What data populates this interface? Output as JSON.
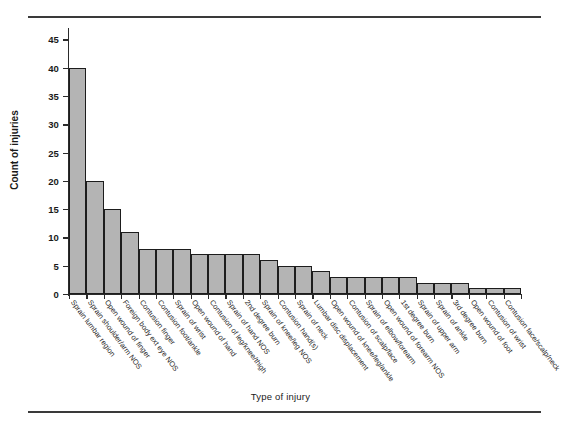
{
  "chart_data": {
    "type": "bar",
    "title": "",
    "xlabel": "Type of injury",
    "ylabel": "Count of injuries",
    "ylim": [
      0,
      47
    ],
    "yticks": [
      0,
      5,
      10,
      15,
      20,
      25,
      30,
      35,
      40,
      45
    ],
    "grid": false,
    "legend": null,
    "bar_color": "#b4b4b4",
    "bar_edge_color": "#1d1d1d",
    "categories": [
      "Sprain lumbar region",
      "Sprain shoulder/arm NOS",
      "Open wound of finger",
      "Foreign body ext eye NOS",
      "Contusion finger",
      "Contusion foot/ankle",
      "Sprain of wrist",
      "Open wound of hand",
      "Contusion of leg/knee/thigh",
      "Sprain of hand NOS",
      "2nd degree burn",
      "Sprain of knee/leg NOS",
      "Contusion hand(s)",
      "Sprain of neck",
      "Lumbar disc displacement",
      "Open wound of knee/leg/ankle",
      "Contusion of scalp/face",
      "Sprain of elbow/forearm",
      "Open wound of forearm NOS",
      "1st degree burn",
      "Sprain of upper arm",
      "Sprain of ankle",
      "3rd degree burn",
      "Open wound of foot",
      "Contusion of wrist",
      "Contusion face/scalp/neck"
    ],
    "values": [
      40,
      20,
      15,
      11,
      8,
      8,
      8,
      7,
      7,
      7,
      7,
      6,
      5,
      5,
      4,
      3,
      3,
      3,
      3,
      3,
      2,
      2,
      2,
      1,
      1,
      1
    ]
  }
}
